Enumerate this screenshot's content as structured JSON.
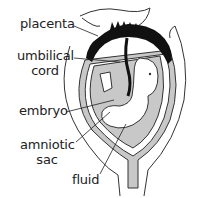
{
  "diagram": {
    "type": "anatomical-diagram",
    "labels": [
      {
        "id": "placenta",
        "text": "placenta"
      },
      {
        "id": "umbilical-cord",
        "line1": "umbilical",
        "line2": "cord"
      },
      {
        "id": "embryo",
        "text": "embryo"
      },
      {
        "id": "amniotic-sac",
        "line1": "amniotic",
        "line2": "sac"
      },
      {
        "id": "fluid",
        "text": "fluid"
      }
    ],
    "colors": {
      "outline": "#333333",
      "placenta": "#111111",
      "fluid_fill": "#c8c8c8",
      "embryo_fill": "#ffffff",
      "background": "#ffffff"
    }
  }
}
